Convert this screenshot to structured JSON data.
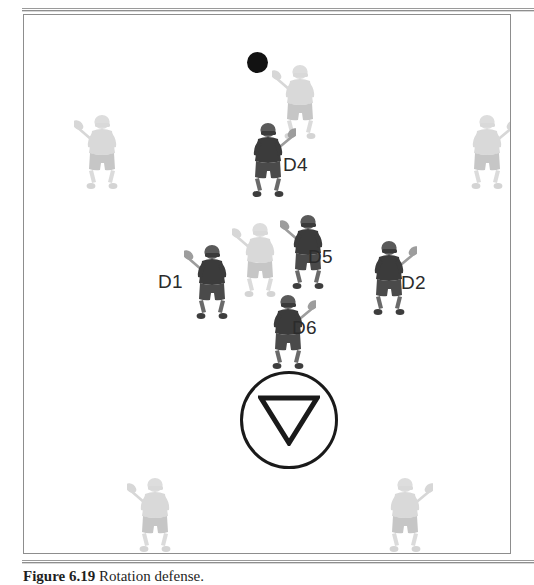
{
  "figure": {
    "caption_label": "Figure 6.19",
    "caption_text": "Rotation defense.",
    "alt_summary": "Lacrosse defensive rotation diagram"
  },
  "field": {
    "border_color": "#8d8d8d",
    "background_color": "#ffffff"
  },
  "goal": {
    "crease_label": "goal-crease",
    "goal_symbol": "inverted-triangle",
    "stroke_color": "#1a1a1a"
  },
  "ball": {
    "label": "ball",
    "color": "#121212"
  },
  "colors": {
    "defender": "#4a4a4a",
    "defender_dark": "#3b3b3b",
    "attacker": "#d8d8d8",
    "attacker_mid": "#c4c4c4",
    "stick": "#b8b8b8",
    "label_text": "#2b2b2b"
  },
  "defenders": [
    {
      "id": "D1",
      "label": "D1",
      "x": 160,
      "y": 222,
      "label_x": 134,
      "label_y": 257,
      "tone": "dark",
      "stick": "left-up"
    },
    {
      "id": "D2",
      "label": "D2",
      "x": 337,
      "y": 218,
      "label_x": 377,
      "label_y": 258,
      "tone": "dark",
      "stick": "right-up"
    },
    {
      "id": "D4",
      "label": "D4",
      "x": 216,
      "y": 100,
      "label_x": 259,
      "label_y": 140,
      "tone": "dark",
      "stick": "right-up"
    },
    {
      "id": "D5",
      "label": "D5",
      "x": 256,
      "y": 192,
      "label_x": 284,
      "label_y": 232,
      "tone": "dark",
      "stick": "left-up"
    },
    {
      "id": "D6",
      "label": "D6",
      "x": 236,
      "y": 272,
      "label_x": 268,
      "label_y": 303,
      "tone": "dark",
      "stick": "right-up"
    }
  ],
  "attackers": [
    {
      "id": "A-top-center",
      "label": "attacker",
      "x": 248,
      "y": 42,
      "tone": "light",
      "stick": "left-up"
    },
    {
      "id": "A-left-upper",
      "label": "attacker",
      "x": 50,
      "y": 92,
      "tone": "light",
      "stick": "left-up"
    },
    {
      "id": "A-right-upper",
      "label": "attacker",
      "x": 435,
      "y": 92,
      "tone": "light",
      "stick": "right-up"
    },
    {
      "id": "A-center-mid",
      "label": "attacker",
      "x": 208,
      "y": 200,
      "tone": "light",
      "stick": "left-up"
    },
    {
      "id": "A-left-lower",
      "label": "attacker",
      "x": 103,
      "y": 455,
      "tone": "light",
      "stick": "left-up"
    },
    {
      "id": "A-right-lower",
      "label": "attacker",
      "x": 353,
      "y": 455,
      "tone": "light",
      "stick": "right-up"
    }
  ],
  "crease_position": {
    "x": 216,
    "y": 356,
    "size": 98
  },
  "ball_position": {
    "x": 223,
    "y": 37
  },
  "chart_data": {
    "type": "diagram",
    "title": "Rotation defense",
    "labels": [
      "D1",
      "D2",
      "D4",
      "D5",
      "D6"
    ],
    "elements": [
      "ball",
      "goal-crease",
      "goal-triangle",
      "field-boundary"
    ]
  }
}
